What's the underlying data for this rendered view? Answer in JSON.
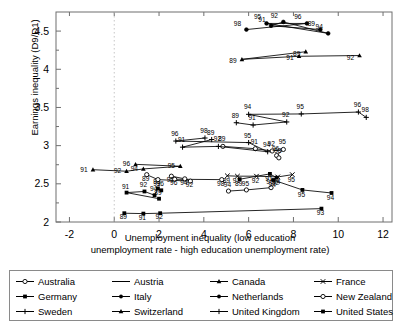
{
  "chart_data": {
    "type": "line",
    "title": "",
    "xlabel": "Unemployment inequality (low education unemployment rate - high education unemployment rate)",
    "xlabel_line1": "Unemployment inequality (low education",
    "xlabel_line2": "unemployment rate - high education unemployment rate)",
    "ylabel": "Earnings inequality (D9/D1)",
    "xlim": [
      -2.6,
      12.4
    ],
    "ylim": [
      2.0,
      4.75
    ],
    "xticks": [
      -2,
      0,
      2,
      4,
      6,
      8,
      10,
      12
    ],
    "xtick_labels": [
      "-2",
      "0",
      "2",
      "4",
      "6",
      "8",
      "10",
      "12"
    ],
    "yticks": [
      2,
      2.5,
      3,
      3.5,
      4,
      4.5
    ],
    "ytick_labels": [
      "2",
      "2.5",
      "3",
      "3.5",
      "4",
      "4.5"
    ],
    "yminorticks": [
      2.25,
      2.75,
      3.25,
      3.75,
      4.25
    ],
    "grid": false,
    "legend_position": "below-axes",
    "point_label_field": "year",
    "series": [
      {
        "name": "Australia",
        "marker": "open-circle",
        "points": [
          {
            "year": "89",
            "x": 4.85,
            "y": 2.99
          },
          {
            "year": "91",
            "x": 6.3,
            "y": 2.96
          },
          {
            "year": "92",
            "x": 7.05,
            "y": 2.93
          },
          {
            "year": "95",
            "x": 7.55,
            "y": 2.95
          },
          {
            "year": "96",
            "x": 7.25,
            "y": 2.87
          },
          {
            "year": "98",
            "x": 7.35,
            "y": 2.84
          }
        ]
      },
      {
        "name": "Austria",
        "marker": "line-only",
        "points": [
          {
            "year": "94",
            "x": 5.1,
            "y": 2.405
          },
          {
            "year": "95",
            "x": 5.9,
            "y": 2.42
          },
          {
            "year": "96",
            "x": 7.0,
            "y": 2.45
          }
        ]
      },
      {
        "name": "Canada",
        "marker": "filled-triangle",
        "points": [
          {
            "year": "89",
            "x": 8.55,
            "y": 4.23
          },
          {
            "year": "89b",
            "x": 5.7,
            "y": 4.13
          },
          {
            "year": "91",
            "x": 8.25,
            "y": 4.17
          },
          {
            "year": "92",
            "x": 10.95,
            "y": 4.18
          }
        ]
      },
      {
        "name": "France",
        "marker": "x-cross",
        "points": [
          {
            "year": "89",
            "x": 5.05,
            "y": 2.605
          },
          {
            "year": "91",
            "x": 5.5,
            "y": 2.6
          },
          {
            "year": "92",
            "x": 6.35,
            "y": 2.6
          },
          {
            "year": "94",
            "x": 7.3,
            "y": 2.59
          },
          {
            "year": "95",
            "x": 7.95,
            "y": 2.62
          }
        ]
      },
      {
        "name": "Germany",
        "marker": "filled-square",
        "points": [
          {
            "year": "89",
            "x": 2.0,
            "y": 2.305
          },
          {
            "year": "91",
            "x": 0.55,
            "y": 2.385
          },
          {
            "year": "92",
            "x": 1.35,
            "y": 2.4
          },
          {
            "year": "94",
            "x": 1.8,
            "y": 2.35
          },
          {
            "year": "95",
            "x": 1.95,
            "y": 2.44
          },
          {
            "year": "96",
            "x": 2.1,
            "y": 2.415
          }
        ]
      },
      {
        "name": "Italy",
        "marker": "filled-square",
        "points": [
          {
            "year": "89",
            "x": 0.45,
            "y": 2.115
          },
          {
            "year": "91",
            "x": 1.3,
            "y": 2.11
          },
          {
            "year": "92",
            "x": 2.05,
            "y": 2.115
          },
          {
            "year": "93",
            "x": 9.25,
            "y": 2.175
          }
        ]
      },
      {
        "name": "Netherlands",
        "marker": "filled-circle",
        "points": [
          {
            "year": "89",
            "x": 9.2,
            "y": 4.52
          },
          {
            "year": "91",
            "x": 7.0,
            "y": 4.57
          },
          {
            "year": "92",
            "x": 7.55,
            "y": 4.62
          },
          {
            "year": "94",
            "x": 9.55,
            "y": 4.47
          },
          {
            "year": "95",
            "x": 6.8,
            "y": 4.6
          },
          {
            "year": "96",
            "x": 8.6,
            "y": 4.6
          },
          {
            "year": "98",
            "x": 5.9,
            "y": 4.52
          }
        ]
      },
      {
        "name": "New Zealand",
        "marker": "open-circle",
        "points": [
          {
            "year": "89",
            "x": 1.45,
            "y": 2.62
          },
          {
            "year": "91",
            "x": 1.95,
            "y": 2.555
          },
          {
            "year": "92",
            "x": 3.4,
            "y": 2.535
          },
          {
            "year": "94",
            "x": 3.15,
            "y": 2.565
          },
          {
            "year": "95",
            "x": 2.55,
            "y": 2.6
          },
          {
            "year": "96",
            "x": 2.7,
            "y": 2.56
          },
          {
            "year": "98",
            "x": 4.8,
            "y": 2.555
          }
        ]
      },
      {
        "name": "Sweden",
        "marker": "plus",
        "points": [
          {
            "year": "89",
            "x": 4.35,
            "y": 3.08
          },
          {
            "year": "91",
            "x": 3.05,
            "y": 2.98
          },
          {
            "year": "92",
            "x": 4.65,
            "y": 2.99
          },
          {
            "year": "94",
            "x": 6.85,
            "y": 2.92
          },
          {
            "year": "95",
            "x": 6.0,
            "y": 3.04
          },
          {
            "year": "96",
            "x": 2.75,
            "y": 3.06
          },
          {
            "year": "98",
            "x": 4.05,
            "y": 3.1
          }
        ]
      },
      {
        "name": "Switzerland",
        "marker": "filled-triangle",
        "points": [
          {
            "year": "91",
            "x": -0.95,
            "y": 2.685
          },
          {
            "year": "92",
            "x": 0.55,
            "y": 2.665
          },
          {
            "year": "94",
            "x": 1.3,
            "y": 2.695
          },
          {
            "year": "95",
            "x": 2.95,
            "y": 2.73
          },
          {
            "year": "96",
            "x": 0.95,
            "y": 2.755
          }
        ]
      },
      {
        "name": "United Kingdom",
        "marker": "plus",
        "points": [
          {
            "year": "89",
            "x": 5.45,
            "y": 3.3
          },
          {
            "year": "91",
            "x": 6.2,
            "y": 3.27
          },
          {
            "year": "92",
            "x": 7.7,
            "y": 3.31
          },
          {
            "year": "94",
            "x": 6.0,
            "y": 3.41
          },
          {
            "year": "95",
            "x": 8.35,
            "y": 3.415
          },
          {
            "year": "96",
            "x": 10.9,
            "y": 3.44
          },
          {
            "year": "98",
            "x": 11.25,
            "y": 3.37
          }
        ]
      },
      {
        "name": "United States",
        "marker": "filled-square",
        "points": [
          {
            "year": "89",
            "x": 5.6,
            "y": 2.56
          },
          {
            "year": "91",
            "x": 6.95,
            "y": 2.63
          },
          {
            "year": "92",
            "x": 7.25,
            "y": 2.58
          },
          {
            "year": "94",
            "x": 7.1,
            "y": 2.55
          },
          {
            "year": "95",
            "x": 8.4,
            "y": 2.42
          },
          {
            "year": "94b",
            "x": 9.7,
            "y": 2.38
          }
        ]
      }
    ]
  },
  "legend": {
    "items": [
      {
        "label": "Australia",
        "marker": "open-circle"
      },
      {
        "label": "Austria",
        "marker": "line-only"
      },
      {
        "label": "Canada",
        "marker": "filled-triangle"
      },
      {
        "label": "France",
        "marker": "x-cross"
      },
      {
        "label": "Germany",
        "marker": "filled-square"
      },
      {
        "label": "Italy",
        "marker": "filled-circle"
      },
      {
        "label": "Netherlands",
        "marker": "filled-circle"
      },
      {
        "label": "New Zealand",
        "marker": "open-circle"
      },
      {
        "label": "Sweden",
        "marker": "plus"
      },
      {
        "label": "Switzerland",
        "marker": "filled-triangle"
      },
      {
        "label": "United Kingdom",
        "marker": "plus"
      },
      {
        "label": "United States",
        "marker": "filled-square"
      }
    ]
  },
  "colors": {
    "ink": "#000000",
    "axis": "#6f6f6f",
    "legend_border": "#8a8a8a",
    "background": "#ffffff"
  }
}
